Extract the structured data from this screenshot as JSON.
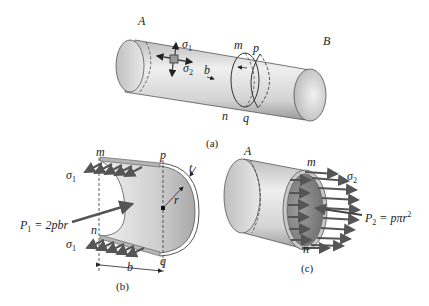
{
  "figure": {
    "panels": [
      {
        "id": "a",
        "caption": "(a)",
        "labels": {
          "end_left": "A",
          "end_right": "B",
          "section_top_1": "m",
          "section_top_2": "p",
          "section_bottom_1": "n",
          "section_bottom_2": "q",
          "width": "b",
          "stress_1": "σ",
          "stress_1_sub": "1",
          "stress_2": "σ",
          "stress_2_sub": "2"
        }
      },
      {
        "id": "b",
        "caption": "(b)",
        "labels": {
          "top_left": "m",
          "top_right": "p",
          "bottom_left": "n",
          "bottom_right": "q",
          "radius": "r",
          "thickness": "t",
          "width": "b",
          "stress_top": "σ",
          "stress_top_sub": "1",
          "stress_bottom": "σ",
          "stress_bottom_sub": "1",
          "force_lhs": "P",
          "force_sub": "1",
          "force_rhs": " = 2pbr"
        }
      },
      {
        "id": "c",
        "caption": "(c)",
        "labels": {
          "end_left": "A",
          "top": "m",
          "bottom": "n",
          "stress": "σ",
          "stress_sub": "2",
          "force_lhs": "P",
          "force_sub": "2",
          "force_rhs": " = pπr",
          "force_sup": "2"
        }
      }
    ],
    "colors": {
      "cylinder_light": "#ececec",
      "cylinder_mid": "#c8c8c8",
      "cylinder_dark": "#8a8a8a",
      "arrow": "#555555",
      "line": "#333333"
    }
  }
}
